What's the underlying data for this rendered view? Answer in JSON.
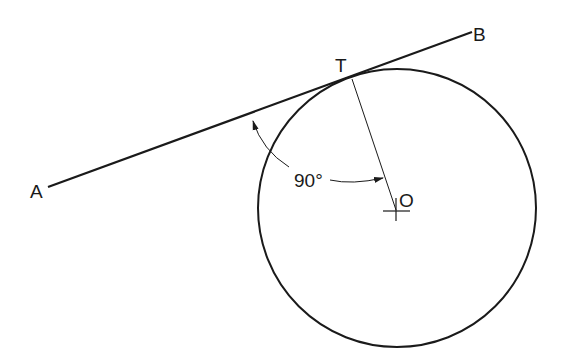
{
  "diagram": {
    "labels": {
      "point_a": "A",
      "point_b": "B",
      "tangent_point": "T",
      "center": "O",
      "angle": "90°"
    },
    "colors": {
      "stroke": "#1a1a1a",
      "background": "#ffffff"
    }
  }
}
